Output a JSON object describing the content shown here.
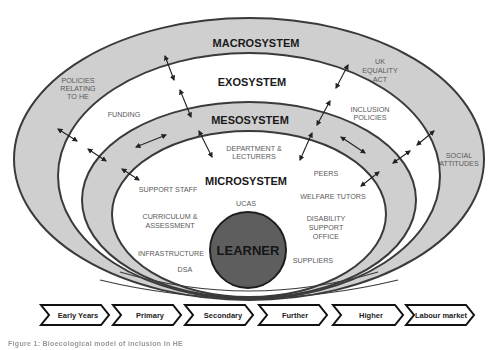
{
  "colors": {
    "band_fill": "#cfcfcf",
    "white_fill": "#ffffff",
    "outline": "#3a3a3a",
    "learner_fill": "#5e5e5e",
    "item_text": "#5a5a5a",
    "label_text": "#1a1a1a"
  },
  "systems": {
    "macro": {
      "label": "MACROSYSTEM"
    },
    "exo": {
      "label": "EXOSYSTEM"
    },
    "meso": {
      "label": "MESOSYSTEM"
    },
    "micro": {
      "label": "MICROSYSTEM"
    }
  },
  "center": {
    "label": "LEARNER"
  },
  "items": {
    "policies_he": [
      "POLICIES",
      "RELATING",
      "TO HE"
    ],
    "uk_equality": [
      "UK",
      "EQUALITY",
      "ACT"
    ],
    "social_attitudes": [
      "SOCIAL",
      "ATTITUDES"
    ],
    "funding": [
      "FUNDING"
    ],
    "inclusion_policies": [
      "INCLUSION",
      "POLICIES"
    ],
    "department": [
      "DEPARTMENT &",
      "LECTURERS"
    ],
    "peers": [
      "PEERS"
    ],
    "support_staff": [
      "SUPPORT STAFF"
    ],
    "welfare_tutors": [
      "WELFARE TUTORS"
    ],
    "ucas": [
      "UCAS"
    ],
    "curriculum": [
      "CURRICULUM &",
      "ASSESSMENT"
    ],
    "disability_office": [
      "DISABILITY",
      "SUPPORT",
      "OFFICE"
    ],
    "infrastructure": [
      "INFRASTRUCTURE"
    ],
    "dsa": [
      "DSA"
    ],
    "suppliers": [
      "SUPPLIERS"
    ]
  },
  "timeline": [
    {
      "label": "Early Years"
    },
    {
      "label": "Primary"
    },
    {
      "label": "Secondary"
    },
    {
      "label": "Further"
    },
    {
      "label": "Higher"
    },
    {
      "label": "Labour market"
    }
  ],
  "caption": "Figure 1: Bioecological model of inclusion in HE"
}
